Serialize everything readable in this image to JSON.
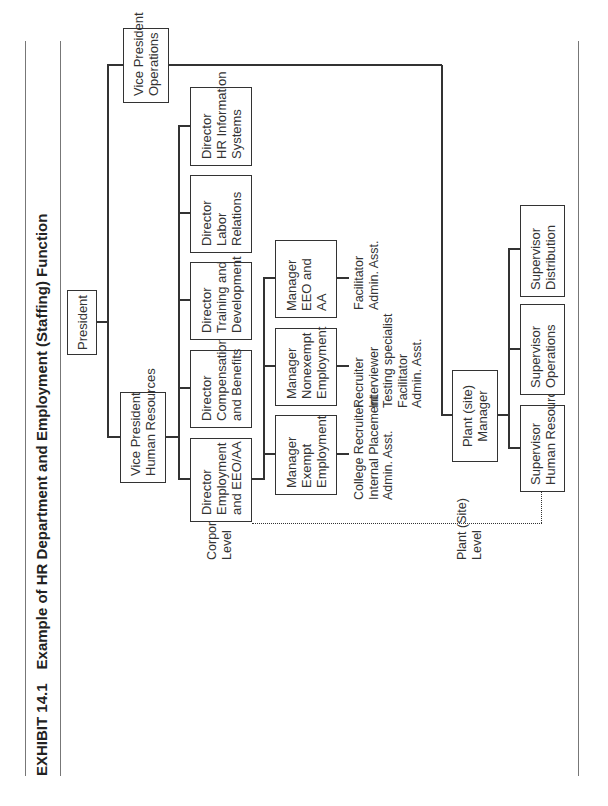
{
  "title": {
    "exhibit": "EXHIBIT 14.1",
    "text": "Example of HR Department and Employment (Staffing) Function"
  },
  "levels": {
    "corporate": [
      "Corporate",
      "Level"
    ],
    "plant": [
      "Plant (Site)",
      "Level"
    ]
  },
  "nodes": {
    "president": [
      "President"
    ],
    "vp_hr": [
      "Vice President",
      "Human Resources"
    ],
    "vp_ops": [
      "Vice President",
      "Operations"
    ],
    "dir_employment": [
      "Director",
      "Employment",
      "and EEO/AA"
    ],
    "dir_comp": [
      "Director",
      "Compensation",
      "and Benefits"
    ],
    "dir_training": [
      "Director",
      "Training and",
      "Development"
    ],
    "dir_labor": [
      "Director",
      "Labor",
      "Relations"
    ],
    "dir_hris": [
      "Director",
      "HR Information",
      "Systems"
    ],
    "mgr_exempt": [
      "Manager",
      "Exempt",
      "Employment"
    ],
    "mgr_nonexempt": [
      "Manager",
      "Nonexempt",
      "Employment"
    ],
    "mgr_eeo": [
      "Manager",
      "EEO and",
      "AA"
    ],
    "plant_mgr": [
      "Plant (site)",
      "Manager"
    ],
    "sup_hr": [
      "Supervisor",
      "Human Resources"
    ],
    "sup_ops": [
      "Supervisor",
      "Operations"
    ],
    "sup_dist": [
      "Supervisor",
      "Distribution"
    ]
  },
  "staff": {
    "exempt": [
      "College Recruiter",
      "Internal Placement",
      "Admin. Asst."
    ],
    "nonexempt": [
      "Recruiter",
      "Interviewer",
      "Testing specialist",
      "Facilitator",
      "Admin. Asst."
    ],
    "eeo": [
      "Facilitator",
      "Admin. Asst."
    ]
  }
}
